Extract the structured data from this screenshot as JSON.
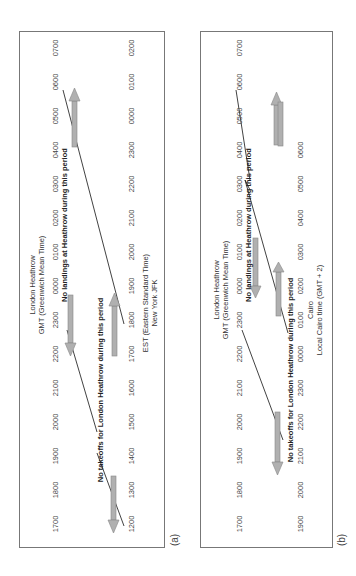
{
  "panels": [
    {
      "id": "a",
      "label": "(a)",
      "top_axis": {
        "title_line1": "London Heathrow",
        "title_line2": "GMT (Greenwich Mean Time)",
        "ticks": [
          "1700",
          "1800",
          "1900",
          "2000",
          "2100",
          "2200",
          "2300",
          "0000",
          "0100",
          "0200",
          "0300",
          "0400",
          "0500",
          "0600",
          "0700"
        ]
      },
      "bottom_axis": {
        "title_line1": "EST (Eastern Standard Time)",
        "title_line2": "New York JFK",
        "ticks": [
          "1200",
          "1300",
          "1400",
          "1500",
          "1600",
          "1700",
          "1800",
          "1900",
          "2000",
          "2100",
          "2200",
          "2300",
          "0000",
          "0100",
          "0200"
        ]
      },
      "annotations": {
        "no_takeoffs": "No takeoffs for London Heathrow during this period",
        "no_landings": "No landings at Heathrow during this period"
      }
    },
    {
      "id": "b",
      "label": "(b)",
      "top_axis": {
        "title_line1": "London Heathrow",
        "title_line2": "GMT (Greenwich Mean Time)",
        "ticks": [
          "1700",
          "1800",
          "1900",
          "2000",
          "2100",
          "2200",
          "2300",
          "0000",
          "0100",
          "0200",
          "0300",
          "0400",
          "0500",
          "0600",
          "0700"
        ]
      },
      "bottom_axis": {
        "title_line1": "Cairo",
        "title_line2": "Local Cairo time (GMT + 2)",
        "ticks": [
          "1900",
          "2000",
          "2100",
          "2200",
          "2300",
          "0000",
          "0100",
          "0200",
          "0300",
          "0400",
          "0500",
          "0600"
        ]
      },
      "annotations": {
        "no_takeoffs": "No takeoffs for London Heathrow during this period",
        "no_landings": "No landings at Heathrow during this period"
      }
    }
  ],
  "colors": {
    "arrow_fill": "#b0b0b0",
    "arrow_stroke": "#888888",
    "line": "#111111",
    "frame": "#777777"
  }
}
